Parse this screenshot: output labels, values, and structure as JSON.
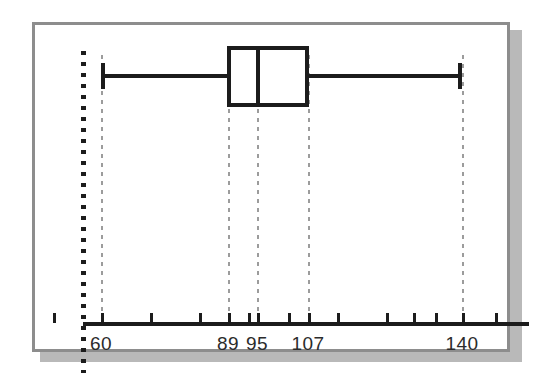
{
  "chart_data": {
    "type": "box",
    "title": "",
    "xlabel": "",
    "ylabel": "",
    "orientation": "horizontal",
    "grid": true,
    "gridline_style": "dashed",
    "xlim": [
      48,
      152
    ],
    "five_number_summary": {
      "minimum": 60,
      "q1": 89,
      "median": 95,
      "q3": 107,
      "maximum": 140
    },
    "labeled_ticks": [
      {
        "value": 60,
        "label": "60",
        "px": 98
      },
      {
        "value": 89,
        "label": "89",
        "px": 225
      },
      {
        "value": 95,
        "label": "95",
        "px": 254
      },
      {
        "value": 107,
        "label": "107",
        "px": 305
      },
      {
        "value": 140,
        "label": "140",
        "px": 459
      }
    ],
    "axis_ticks_px": [
      50,
      98,
      147,
      196,
      225,
      245,
      254,
      285,
      305,
      334,
      383,
      410,
      432,
      459,
      492
    ],
    "colors": {
      "box_stroke": "#1c1c1c",
      "box_fill": "#ffffff",
      "whisker": "#1c1c1c",
      "axis": "#1c1c1c",
      "gridline": "#9c9c9c",
      "frame_border": "#8d8d8d",
      "shadow": "#b9b9b9",
      "background": "#ffffff",
      "label_text": "#2b2b2b"
    }
  },
  "geometry": {
    "whisker_left_px": 98,
    "whisker_right_px": 459,
    "box_left_px": 224,
    "box_right_px": 306,
    "median_px": 253,
    "box_top_px": 43,
    "box_bottom_px": 104,
    "whisker_y_px": 71
  }
}
